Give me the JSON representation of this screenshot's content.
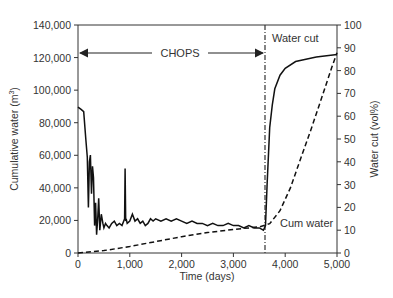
{
  "chart_data": {
    "type": "line",
    "title": "",
    "xlabel": "Time (days)",
    "ylabel_left": "Cumulative water (m3)",
    "ylabel_right": "Water cut (vol%)",
    "xlim": [
      0,
      5000
    ],
    "ylim_left": [
      0,
      140000
    ],
    "ylim_right": [
      0,
      100
    ],
    "x_ticks": [
      "0",
      "1,000",
      "2,000",
      "3,000",
      "4,000",
      "5,000"
    ],
    "y_left_ticks": [
      "0",
      "20,000",
      "40,000",
      "60,000",
      "80,000",
      "100,000",
      "120,000",
      "140,000"
    ],
    "y_right_ticks": [
      "0",
      "10",
      "20",
      "30",
      "40",
      "50",
      "60",
      "70",
      "80",
      "90",
      "100"
    ],
    "grid": false,
    "legend": null,
    "annotations": [
      {
        "text": "CHOPS",
        "type": "double-arrow",
        "x_from": 0,
        "x_to": 3600,
        "y_left": 123000
      },
      {
        "text": "Water cut",
        "x": 3850,
        "y_right": 89
      },
      {
        "text": "Cum water",
        "x": 3850,
        "y_right": 12
      },
      {
        "type": "vertical-dashdot-line",
        "x": 3600
      }
    ],
    "series": [
      {
        "name": "Water cut",
        "axis": "right",
        "style": "solid",
        "x": [
          0,
          60,
          110,
          150,
          180,
          200,
          220,
          240,
          260,
          280,
          300,
          320,
          340,
          360,
          380,
          400,
          420,
          450,
          480,
          500,
          530,
          560,
          600,
          650,
          700,
          750,
          800,
          850,
          900,
          910,
          920,
          930,
          950,
          1000,
          1050,
          1100,
          1150,
          1200,
          1250,
          1300,
          1350,
          1400,
          1450,
          1500,
          1600,
          1700,
          1800,
          1900,
          2000,
          2100,
          2200,
          2300,
          2400,
          2500,
          2600,
          2700,
          2800,
          2900,
          3000,
          3100,
          3200,
          3300,
          3400,
          3500,
          3580,
          3620,
          3650,
          3700,
          3750,
          3800,
          3900,
          4000,
          4200,
          4400,
          4600,
          4800,
          5000
        ],
        "values": [
          64,
          63,
          62,
          50,
          42,
          20,
          40,
          43,
          26,
          38,
          33,
          12,
          22,
          8,
          15,
          24,
          10,
          17,
          13,
          11,
          13,
          12,
          11,
          13,
          14,
          12,
          13,
          12,
          15,
          37,
          14,
          15,
          13,
          14,
          17,
          14,
          15,
          13,
          14,
          12,
          13,
          15,
          14,
          15,
          14,
          15,
          14,
          15,
          14,
          13,
          14,
          13,
          13,
          12,
          13,
          12,
          12,
          13,
          12,
          12,
          11,
          12,
          11,
          11,
          10,
          12,
          30,
          55,
          65,
          72,
          78,
          81,
          84,
          85,
          86,
          86.5,
          87
        ]
      },
      {
        "name": "Cum water",
        "axis": "left",
        "style": "dashed",
        "x": [
          0,
          500,
          1000,
          1500,
          2000,
          2500,
          3000,
          3500,
          3700,
          3900,
          4100,
          4300,
          4500,
          4700,
          4900,
          5000
        ],
        "values": [
          0,
          1500,
          4000,
          7000,
          10000,
          12500,
          14500,
          16000,
          18000,
          26000,
          40000,
          58000,
          76000,
          95000,
          114000,
          123000
        ]
      }
    ]
  }
}
